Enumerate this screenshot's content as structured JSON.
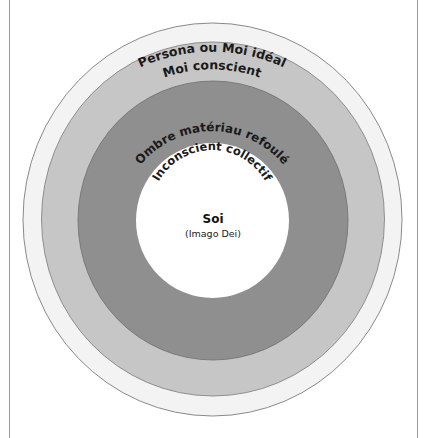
{
  "diagram": {
    "layers": [
      {
        "id": "persona",
        "label": "Persona ou Moi idéal",
        "fill": "#f3f3f3"
      },
      {
        "id": "moi",
        "label": "Moi conscient",
        "fill": "#c6c6c6"
      },
      {
        "id": "ombre",
        "label": "Ombre matériau refoulé",
        "fill": "#8f8f8f"
      },
      {
        "id": "inconscient",
        "label": "Inconscient collectif",
        "fill": "#ffffff"
      }
    ],
    "core": {
      "title": "Soi",
      "subtitle": "(Imago Dei)"
    }
  }
}
